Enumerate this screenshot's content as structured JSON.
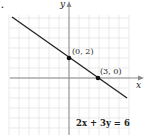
{
  "problem_marker": ".",
  "chart_data": {
    "type": "line",
    "title": "",
    "equation": "2x + 3y = 6",
    "xlabel": "x",
    "ylabel": "y",
    "grid": true,
    "xlim": [
      -6,
      6
    ],
    "ylim": [
      -6,
      6
    ],
    "series": [
      {
        "name": "2x + 3y = 6",
        "x": [
          -5.7,
          5.8
        ],
        "y": [
          5.8,
          -1.9
        ]
      }
    ],
    "points": [
      {
        "label": "(0, 2)",
        "x": 0,
        "y": 2
      },
      {
        "label": "(3, 0)",
        "x": 3,
        "y": 0
      }
    ]
  },
  "labels": {
    "x_axis": "x",
    "y_axis": "y",
    "point_a": "(0, 2)",
    "point_b": "(3, 0)",
    "equation": "2x + 3y = 6"
  },
  "colors": {
    "grid": "#dcdcdc",
    "axis": "#888888",
    "line": "#222222",
    "point": "#111111"
  }
}
